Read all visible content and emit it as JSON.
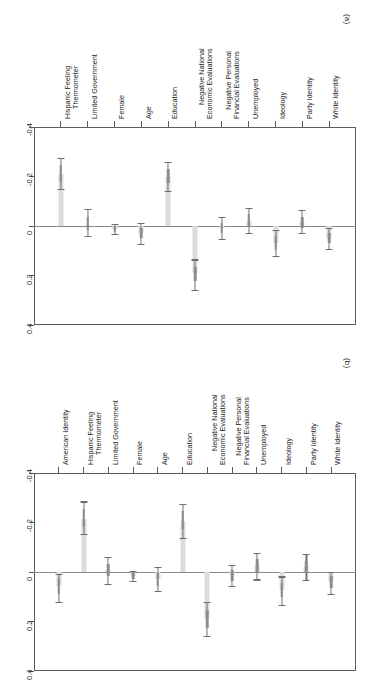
{
  "figure": {
    "orientation": "rotated-90",
    "panels": [
      "(a)",
      "(b)"
    ]
  },
  "chart_data": [
    {
      "type": "bar",
      "panel": "(a)",
      "title": "",
      "xlabel": "",
      "ylabel": "",
      "ylim": [
        -0.4,
        0.4
      ],
      "yticks": [
        -0.4,
        -0.2,
        0,
        0.2,
        0.4
      ],
      "ytick_labels": [
        "-0.4",
        "-0.2",
        "0",
        "0.2",
        "0.4"
      ],
      "y_axis_inverted": true,
      "grid": false,
      "legend": "none",
      "zero_reference_line": 0,
      "categories": [
        "Hispanic Feeling Thermometer",
        "Limited Government",
        "Female",
        "Age",
        "Education",
        "Negative National Economic Evaluations",
        "Negative Personal Financial Evaluations",
        "Unemployed",
        "Ideology",
        "Party Identity",
        "White Identity"
      ],
      "values": [
        -0.21,
        -0.005,
        0.012,
        0.03,
        -0.2,
        0.19,
        0.008,
        -0.022,
        0.068,
        -0.016,
        0.048
      ],
      "ci_low": [
        -0.275,
        -0.068,
        -0.008,
        -0.012,
        -0.26,
        0.135,
        -0.035,
        -0.072,
        0.015,
        -0.066,
        0.008
      ],
      "ci_high": [
        -0.148,
        0.042,
        0.032,
        0.072,
        -0.142,
        0.258,
        0.052,
        0.028,
        0.122,
        0.028,
        0.092
      ],
      "inner_low": [
        -0.245,
        -0.035,
        -0.002,
        0.008,
        -0.23,
        0.165,
        -0.012,
        -0.048,
        0.042,
        -0.038,
        0.028
      ],
      "inner_high": [
        -0.178,
        0.018,
        0.024,
        0.05,
        -0.172,
        0.222,
        0.03,
        0.006,
        0.096,
        0.008,
        0.07
      ]
    },
    {
      "type": "bar",
      "panel": "(b)",
      "title": "",
      "xlabel": "",
      "ylabel": "",
      "ylim": [
        -0.4,
        0.4
      ],
      "yticks": [
        -0.4,
        -0.2,
        0,
        0.2,
        0.4
      ],
      "ytick_labels": [
        "-0.4",
        "-0.2",
        "0",
        "0.2",
        "0.4"
      ],
      "y_axis_inverted": true,
      "grid": false,
      "legend": "none",
      "zero_reference_line": 0,
      "categories": [
        "American Identity",
        "Hispanic Feeling Thermometer",
        "Limited Government",
        "Female",
        "Age",
        "Education",
        "Negative National Economic Evaluations",
        "Negative Personal Financial Evaluations",
        "Unemployed",
        "Ideology",
        "Party Identity",
        "White Identity"
      ],
      "values": [
        0.058,
        -0.215,
        -0.008,
        0.015,
        0.028,
        -0.205,
        0.185,
        0.012,
        -0.028,
        0.072,
        -0.022,
        0.04
      ],
      "ci_low": [
        0.008,
        -0.285,
        -0.062,
        -0.005,
        -0.022,
        -0.275,
        0.122,
        -0.028,
        -0.078,
        0.018,
        -0.072,
        0.0
      ],
      "ci_high": [
        0.122,
        -0.152,
        0.048,
        0.036,
        0.078,
        -0.138,
        0.26,
        0.058,
        0.03,
        0.132,
        0.032,
        0.09
      ],
      "inner_low": [
        0.028,
        -0.255,
        -0.032,
        0.002,
        0.004,
        -0.245,
        0.155,
        -0.008,
        -0.052,
        0.045,
        -0.045,
        0.018
      ],
      "inner_high": [
        0.09,
        -0.18,
        0.018,
        0.028,
        0.055,
        -0.172,
        0.225,
        0.035,
        0.004,
        0.1,
        0.006,
        0.065
      ]
    }
  ]
}
